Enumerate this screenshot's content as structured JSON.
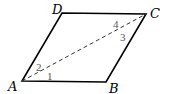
{
  "figure": {
    "type": "parallelogram",
    "vertices": {
      "A": {
        "label": "A",
        "x": 22,
        "y": 81
      },
      "B": {
        "label": "B",
        "x": 106,
        "y": 82
      },
      "C": {
        "label": "C",
        "x": 146,
        "y": 14
      },
      "D": {
        "label": "D",
        "x": 62,
        "y": 13
      }
    },
    "diagonal": {
      "from": "A",
      "to": "C",
      "style": "dashed"
    },
    "angle_labels": [
      {
        "label": "1",
        "near": "A",
        "x": 46,
        "y": 80
      },
      {
        "label": "2",
        "near": "A",
        "x": 35,
        "y": 72
      },
      {
        "label": "3",
        "near": "C",
        "x": 120,
        "y": 40
      },
      {
        "label": "4",
        "near": "C",
        "x": 112,
        "y": 28
      }
    ],
    "colors": {
      "stroke": "#000000",
      "angle_text": "#555555"
    }
  }
}
